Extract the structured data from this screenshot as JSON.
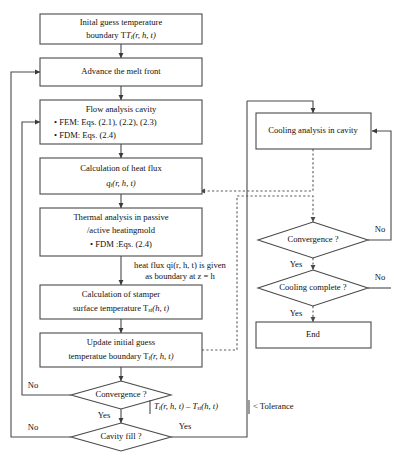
{
  "diagram": {
    "colors": {
      "stroke": "#4a4a4a",
      "dashed": "#5a5a5a",
      "text": "#111111",
      "background": "#ffffff"
    },
    "nodes": {
      "initial_guess": {
        "line1": "Inital guess temperature",
        "line2_pre": "boundary T",
        "line2_sub": "i",
        "line2_post": "(r, h, t)",
        "shape": "process"
      },
      "advance_melt": {
        "line1": "Advance the melt front",
        "shape": "process"
      },
      "flow_analysis": {
        "line1": "Flow analysis cavity",
        "line2": "• FEM: Eqs. (2.1), (2.2), (2.3)",
        "line3": "• FDM: Eqs. (2.4)",
        "shape": "process"
      },
      "heat_flux": {
        "line1": "Calculation of heat flux",
        "line2_pre": "q",
        "line2_sub": "i",
        "line2_post": "(r, h, t)",
        "shape": "process"
      },
      "thermal_analysis": {
        "line1": "Thermal analysis in passive",
        "line2": "/active heatingmold",
        "line3": "• FDM :Eqs. (2.4)",
        "shape": "process"
      },
      "stamper_temp": {
        "line1": "Calculation of stamper",
        "line2_pre": "surface temperature T",
        "line2_sub": "st",
        "line2_post": "(h, t)",
        "shape": "process"
      },
      "update_guess": {
        "line1": "Update initial guess",
        "line2_pre": "temperatue boundary T",
        "line2_sub": "i",
        "line2_post": "(r, h, t)",
        "shape": "process"
      },
      "cooling_analysis": {
        "line1": "Cooling analysis in cavity",
        "shape": "process"
      },
      "end": {
        "line1": "End",
        "shape": "process"
      },
      "convergence_left": {
        "line1": "Convergence ?",
        "shape": "decision"
      },
      "cavity_fill": {
        "line1": "Cavity fill ?",
        "shape": "decision"
      },
      "convergence_right": {
        "line1": "Convergence ?",
        "shape": "decision"
      },
      "cooling_complete": {
        "line1": "Cooling complete ?",
        "shape": "decision"
      }
    },
    "annotations": {
      "heat_flux_note_line1": "heat flux qi(r, h, t) is given",
      "heat_flux_note_line2": "as boundary at z = h",
      "tolerance_pre": "T",
      "tolerance_sub1": "i",
      "tolerance_mid": "(r, h, t) – T",
      "tolerance_sub2": "st",
      "tolerance_post": "(h, t)",
      "tolerance_tail": "< Tolerance"
    },
    "edge_labels": {
      "conv_left_no": "No",
      "conv_left_yes": "Yes",
      "cavity_fill_no": "No",
      "cavity_fill_yes": "Yes",
      "conv_right_no": "No",
      "conv_right_yes": "Yes",
      "cooling_complete_no": "No",
      "cooling_complete_yes": "Yes"
    }
  }
}
